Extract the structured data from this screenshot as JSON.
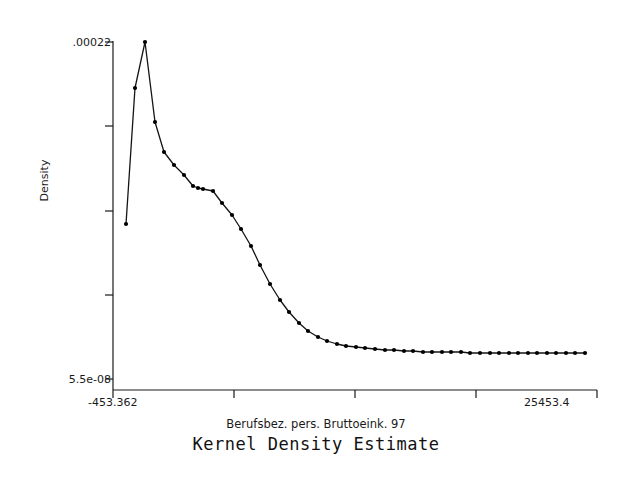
{
  "chart_data": {
    "type": "line",
    "title": "Kernel Density Estimate",
    "xlabel": "Berufsbez. pers. Bruttoeink. 97",
    "ylabel": "Density",
    "xlim": [
      -453.362,
      25453.4
    ],
    "ylim": [
      5.5e-08,
      0.00022
    ],
    "xtick_labels": [
      "-453.362",
      "25453.4"
    ],
    "ytick_labels": [
      ".00022",
      "5.5e-08"
    ],
    "x_major_ticks": [
      -453.362,
      6021.83,
      12497.02,
      18972.21,
      25453.4
    ],
    "y_major_ticks": [
      5.5e-08,
      5.5e-05,
      0.00011,
      0.000165,
      0.00022
    ],
    "grid": false,
    "legend": false,
    "markers": "filled-circle",
    "marker_color": "#000000",
    "line_color": "#000000",
    "background": "#ffffff",
    "x": [
      242,
      490,
      738,
      987,
      1235,
      1483,
      1731,
      1980,
      2228,
      2476,
      2724,
      2973,
      3221,
      3469,
      3717,
      3966,
      4214,
      4462,
      4710,
      4959,
      5207,
      5455,
      5703,
      5952,
      6200,
      6448,
      6696,
      6945,
      7193,
      7441,
      7689,
      7938,
      8186,
      8434,
      8682,
      8931,
      9179,
      9427,
      9675,
      9924,
      10172,
      10420,
      10668,
      10917,
      11165,
      11413,
      11661,
      11910,
      12158,
      12406,
      12654,
      12903,
      13151,
      13399,
      13647,
      13896,
      14144,
      14392,
      14640,
      14889,
      15137,
      15385,
      15633,
      15882,
      16130,
      16378,
      16626,
      16875,
      17123,
      17371,
      17619,
      17868,
      18116,
      18364,
      18612,
      18861,
      19109,
      19357,
      19605,
      19854,
      20102,
      20350,
      20598,
      20847,
      21095,
      21343,
      21591,
      21840,
      22088,
      22336,
      22584,
      22833,
      23081,
      23329,
      23577,
      23826,
      24074,
      24322,
      24570,
      24819
    ],
    "y": [
      0.0001073,
      0.000175,
      0.000219,
      0.0001707,
      0.0001455,
      0.0001352,
      0.0001289,
      0.0001213,
      0.0001187,
      0.0001184,
      0.0001173,
      0.0001095,
      0.0001012,
      9.12e-05,
      7.95e-05,
      6.64e-05,
      5.34e-05,
      4.24e-05,
      3.38e-05,
      2.65e-05,
      2.09e-05,
      1.67e-05,
      1.38e-05,
      1.19e-05,
      1.06e-05,
      9.6e-06,
      8.9e-06,
      8.3e-06,
      7.9e-06,
      7.6e-06,
      7.3e-06,
      7.1e-06,
      6.9e-06,
      6.8e-06,
      6.7e-06,
      6.6e-06,
      6.5e-06,
      6.4e-06,
      6.4e-06,
      6.3e-06,
      6.3e-06,
      6.2e-06,
      6.2e-06,
      6.2e-06,
      6.1e-06,
      6.1e-06,
      6.1e-06,
      6.1e-06,
      6e-06,
      6e-06,
      6e-06,
      6e-06,
      6e-06,
      6e-06,
      6e-06,
      6e-06,
      6e-06,
      6e-06,
      6e-06,
      6e-06,
      6e-06,
      6e-06,
      6e-06,
      6e-06,
      6e-06,
      6e-06,
      6e-06,
      6e-06,
      6e-06,
      6e-06,
      6e-06,
      6e-06,
      6e-06,
      6e-06,
      6e-06,
      6e-06,
      6e-06,
      6e-06,
      6e-06,
      6e-06,
      6e-06,
      6e-06,
      6e-06,
      6e-06,
      6e-06,
      6e-06,
      6e-06,
      6e-06,
      6e-06,
      6e-06,
      6e-06,
      6e-06,
      6e-06,
      6e-06,
      6e-06,
      6e-06,
      6e-06,
      6e-06,
      6e-06,
      6e-06
    ],
    "pixel_points": [
      [
        126,
        224
      ],
      [
        135,
        88
      ],
      [
        145,
        42
      ],
      [
        155,
        122
      ],
      [
        164,
        152
      ],
      [
        174,
        165
      ],
      [
        184,
        175
      ],
      [
        193,
        186
      ],
      [
        198,
        188
      ],
      [
        203,
        189
      ],
      [
        213,
        191
      ],
      [
        222,
        203
      ],
      [
        232,
        215
      ],
      [
        241,
        229
      ],
      [
        251,
        246
      ],
      [
        260,
        265
      ],
      [
        270,
        284
      ],
      [
        280,
        300
      ],
      [
        289,
        312
      ],
      [
        299,
        323
      ],
      [
        308,
        331
      ],
      [
        318,
        337
      ],
      [
        327,
        341
      ],
      [
        337,
        344
      ],
      [
        346,
        346
      ],
      [
        356,
        347
      ],
      [
        365,
        348
      ],
      [
        375,
        349
      ],
      [
        385,
        350
      ],
      [
        394,
        350
      ],
      [
        404,
        351
      ],
      [
        413,
        351
      ],
      [
        423,
        352
      ],
      [
        432,
        352
      ],
      [
        442,
        352
      ],
      [
        451,
        352
      ],
      [
        461,
        352
      ],
      [
        470,
        353
      ],
      [
        480,
        353
      ],
      [
        490,
        353
      ],
      [
        499,
        353
      ],
      [
        509,
        353
      ],
      [
        518,
        353
      ],
      [
        528,
        353
      ],
      [
        537,
        353
      ],
      [
        547,
        353
      ],
      [
        556,
        353
      ],
      [
        566,
        353
      ],
      [
        575,
        353
      ],
      [
        585,
        353
      ]
    ]
  },
  "axes": {
    "y_top_label": ".00022",
    "y_bottom_label": "5.5e-08",
    "x_left_label": "-453.362",
    "x_right_label": "25453.4",
    "y_axis_title": "Density",
    "x_axis_title": "Berufsbez. pers. Bruttoeink. 97",
    "plot_title": "Kernel Density Estimate"
  }
}
